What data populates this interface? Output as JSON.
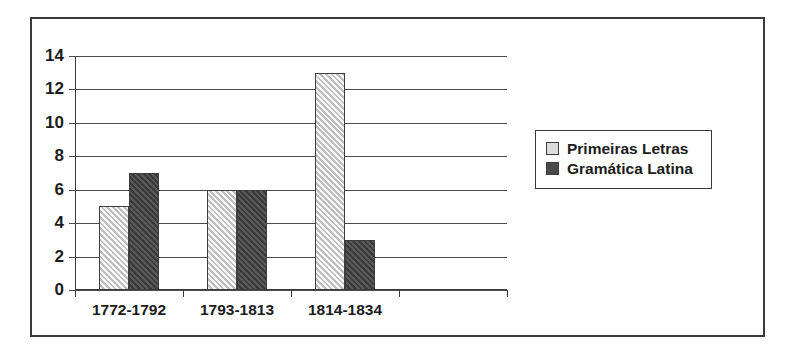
{
  "chart_data": {
    "type": "bar",
    "title": "",
    "subtitle": "",
    "xlabel": "",
    "ylabel": "",
    "categories": [
      "1772-1792",
      "1793-1813",
      "1814-1834"
    ],
    "series": [
      {
        "name": "Primeiras Letras",
        "values": [
          5,
          6,
          13
        ],
        "color": "#d9d9d9"
      },
      {
        "name": "Gramática Latina",
        "values": [
          7,
          6,
          3
        ],
        "color": "#464646"
      }
    ],
    "ylim": [
      0,
      14
    ],
    "ytick_labels": [
      "0",
      "2",
      "4",
      "6",
      "8",
      "10",
      "12",
      "14"
    ],
    "ytick_values": [
      0,
      2,
      4,
      6,
      8,
      10,
      12,
      14
    ],
    "grid": true,
    "grid_axis": "y",
    "legend_position": "right",
    "x_slots": 4,
    "empty_trailing_slot": true
  },
  "legend": {
    "items": [
      {
        "label": "Primeiras Letras",
        "swatch": "light-hatched-square"
      },
      {
        "label": "Gramática Latina",
        "swatch": "dark-hatched-square"
      }
    ]
  },
  "colors": {
    "frame_border": "#3a3a3a",
    "axis": "#3a3a3a",
    "gridline": "#4c4c4c",
    "text": "#1c1c1c",
    "background": "#ffffff",
    "series_light": "#d9d9d9",
    "series_dark": "#464646"
  }
}
